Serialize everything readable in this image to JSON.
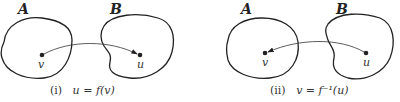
{
  "panels": [
    {
      "id": "i",
      "set_a_label": "A",
      "set_b_label": "B",
      "point_in_a": "v",
      "point_in_b": "u",
      "arrow_direction": "A-to-B",
      "caption_index": "(i)",
      "caption_formula": "u = f(v)"
    },
    {
      "id": "ii",
      "set_a_label": "A",
      "set_b_label": "B",
      "point_in_a": "v",
      "point_in_b": "u",
      "arrow_direction": "B-to-A",
      "caption_index": "(ii)",
      "caption_formula": "v = f⁻¹(u)"
    }
  ],
  "colors": {
    "stroke": "#222222",
    "background": "#ffffff"
  }
}
